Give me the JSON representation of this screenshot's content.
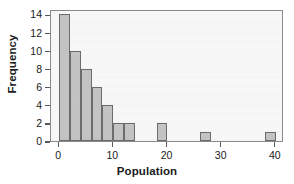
{
  "chart_data": {
    "type": "bar",
    "title": "",
    "subtitle": "",
    "xlabel": "Population",
    "ylabel": "Frequency",
    "xlim": [
      -1.5,
      41.5
    ],
    "ylim": [
      0,
      14.6
    ],
    "grid": false,
    "legend": null,
    "bin_width": 2,
    "x_ticks": [
      0,
      10,
      20,
      30,
      40
    ],
    "x_tick_labels": [
      "0",
      "10",
      "20",
      "30",
      "40"
    ],
    "y_ticks": [
      0,
      2,
      4,
      6,
      8,
      10,
      12,
      14
    ],
    "y_tick_labels": [
      "0",
      "2",
      "4",
      "6",
      "8",
      "10",
      "12",
      "14"
    ],
    "bins": [
      {
        "left": 0,
        "right": 2,
        "frequency": 14
      },
      {
        "left": 2,
        "right": 4,
        "frequency": 10
      },
      {
        "left": 4,
        "right": 6,
        "frequency": 8
      },
      {
        "left": 6,
        "right": 8,
        "frequency": 6
      },
      {
        "left": 8,
        "right": 10,
        "frequency": 4
      },
      {
        "left": 10,
        "right": 12,
        "frequency": 2
      },
      {
        "left": 12,
        "right": 14,
        "frequency": 2
      },
      {
        "left": 18,
        "right": 20,
        "frequency": 2
      },
      {
        "left": 26,
        "right": 28,
        "frequency": 1
      },
      {
        "left": 38,
        "right": 40,
        "frequency": 1
      }
    ],
    "categories": [
      "0-2",
      "2-4",
      "4-6",
      "6-8",
      "8-10",
      "10-12",
      "12-14",
      "18-20",
      "26-28",
      "38-40"
    ],
    "values": [
      14,
      10,
      8,
      6,
      4,
      2,
      2,
      2,
      1,
      1
    ],
    "colors": {
      "bar_fill": "#c3c3c3",
      "bar_edge": "#6b6b6b",
      "frame": "#8a8a8a",
      "text": "#1a1a1a",
      "plot_background": "#f7f7f7",
      "figure_background": "#ffffff"
    }
  }
}
